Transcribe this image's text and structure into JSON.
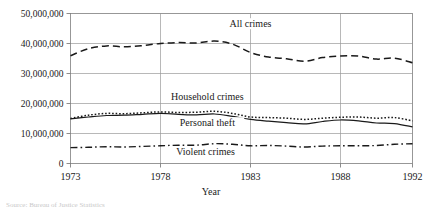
{
  "chart_data": {
    "type": "line",
    "title": "",
    "xlabel": "Year",
    "ylabel": "",
    "xlim": [
      1973,
      1992
    ],
    "ylim": [
      0,
      50000000
    ],
    "grid": true,
    "legend_position": "inline-labels",
    "x_ticks": [
      "1973",
      "1978",
      "1983",
      "1988",
      "1992"
    ],
    "x_tick_values": [
      1973,
      1978,
      1983,
      1988,
      1992
    ],
    "y_ticks": [
      "0",
      "10,000,000",
      "20,000,000",
      "30,000,000",
      "40,000,000",
      "50,000,000"
    ],
    "y_tick_values": [
      0,
      10000000,
      20000000,
      30000000,
      40000000,
      50000000
    ],
    "x": [
      1973,
      1974,
      1975,
      1976,
      1977,
      1978,
      1979,
      1980,
      1981,
      1982,
      1983,
      1984,
      1985,
      1986,
      1987,
      1988,
      1989,
      1990,
      1991,
      1992
    ],
    "series": [
      {
        "name": "All crimes",
        "style": "dashed",
        "label": "All crimes",
        "values": [
          35900000,
          38300000,
          39200000,
          38900000,
          39300000,
          40000000,
          40300000,
          40200000,
          40800000,
          39800000,
          37000000,
          35500000,
          34900000,
          34100000,
          35300000,
          35800000,
          35800000,
          34800000,
          35100000,
          33600000
        ]
      },
      {
        "name": "Household crimes",
        "style": "dotted",
        "label": "Household crimes",
        "values": [
          15000000,
          16100000,
          16700000,
          16600000,
          16900000,
          17200000,
          17000000,
          17100000,
          17400000,
          16700000,
          15500000,
          15300000,
          15100000,
          14700000,
          15100000,
          15400000,
          15500000,
          15100000,
          15300000,
          14200000
        ]
      },
      {
        "name": "Personal theft",
        "style": "solid",
        "label": "Personal theft",
        "values": [
          14900000,
          15500000,
          16000000,
          16100000,
          16400000,
          16700000,
          16400000,
          16200000,
          16500000,
          15700000,
          14700000,
          14100000,
          13600000,
          13200000,
          14000000,
          14500000,
          14200000,
          13500000,
          13300000,
          12200000
        ]
      },
      {
        "name": "Violent crimes",
        "style": "dash-dot",
        "label": "Violent crimes",
        "values": [
          5300000,
          5400000,
          5600000,
          5500000,
          5700000,
          5900000,
          6100000,
          6100000,
          6600000,
          6400000,
          5900000,
          6000000,
          5800000,
          5500000,
          5800000,
          5900000,
          5900000,
          6000000,
          6400000,
          6600000
        ]
      }
    ],
    "annotations": [
      {
        "text": "All crimes",
        "x": 1983,
        "y": 45600000
      },
      {
        "text": "Household crimes",
        "x": 1980.6,
        "y": 21300000
      },
      {
        "text": "Personal theft",
        "x": 1980.6,
        "y": 12600000
      },
      {
        "text": "Violent crimes",
        "x": 1980.5,
        "y": 3000000
      }
    ]
  },
  "footnote": {
    "text": "Source: Bureau of Justice Statistics"
  }
}
